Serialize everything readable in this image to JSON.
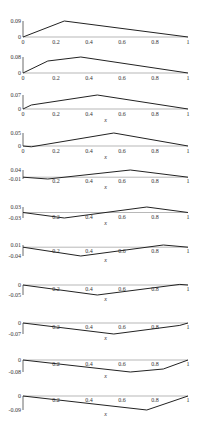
{
  "chart_data": [
    {
      "type": "line",
      "panel": 1,
      "top": 21,
      "base": 37,
      "ymax_label": "0.09",
      "ymin_label": "0",
      "ymax": 0.09,
      "ymin": 0,
      "x": [
        0,
        0.25,
        1
      ],
      "y": [
        0,
        0.09,
        0
      ],
      "xticks": [
        "0",
        "0.2",
        "0.4",
        "0.6",
        "0.8",
        "1"
      ],
      "xlabel": "",
      "xtick_below": true
    },
    {
      "type": "line",
      "panel": 2,
      "top": 57,
      "base": 73,
      "ymax_label": "0.08",
      "ymin_label": "0",
      "ymax": 0.08,
      "ymin": 0,
      "x": [
        0,
        0.15,
        0.35,
        1
      ],
      "y": [
        0,
        0.06,
        0.08,
        0
      ],
      "xticks": [
        "0",
        "0.2",
        "0.4",
        "0.6",
        "0.8",
        "1"
      ],
      "xlabel": "",
      "xtick_below": true
    },
    {
      "type": "line",
      "panel": 3,
      "top": 95,
      "base": 109,
      "ymax_label": "0.07",
      "ymin_label": "0",
      "ymax": 0.07,
      "ymin": 0,
      "x": [
        0,
        0.05,
        0.45,
        1
      ],
      "y": [
        0,
        0.02,
        0.07,
        0
      ],
      "xticks": [
        "0",
        "0.2",
        "0.4",
        "0.6",
        "0.8",
        "1"
      ],
      "xlabel": "x",
      "xtick_below": true
    },
    {
      "type": "line",
      "panel": 4,
      "top": 133,
      "base": 146,
      "ymax_label": "0.05",
      "ymin_label": "0",
      "ymax": 0.05,
      "ymin": 0,
      "x": [
        0,
        0.05,
        0.55,
        1
      ],
      "y": [
        0,
        -0.003,
        0.05,
        0
      ],
      "xticks": [
        "0",
        "0.2",
        "0.4",
        "0.6",
        "0.8",
        "1"
      ],
      "xlabel": "x",
      "xtick_below": true
    },
    {
      "type": "line",
      "panel": 5,
      "top": 170,
      "base": 179,
      "ymax_label": "0.04",
      "ymin_label": "-0.01",
      "ymax": 0.04,
      "ymin": -0.01,
      "x": [
        0,
        0.15,
        0.65,
        1
      ],
      "y": [
        0,
        -0.01,
        0.04,
        0
      ],
      "xticks": [
        "0.2",
        "0.4",
        "0.6",
        "0.8",
        "1"
      ],
      "xlabel": "x",
      "xtick_below": false
    },
    {
      "type": "line",
      "panel": 6,
      "top": 207,
      "base": 218,
      "ymax_label": "0.03",
      "ymin_label": "-0.03",
      "ymax": 0.03,
      "ymin": -0.03,
      "x": [
        0,
        0.25,
        0.75,
        1
      ],
      "y": [
        0,
        -0.03,
        0.03,
        0
      ],
      "xticks": [
        "0.2",
        "0.4",
        "0.6",
        "0.8",
        "1"
      ],
      "xlabel": "x",
      "xtick_below": false
    },
    {
      "type": "line",
      "panel": 7,
      "top": 245,
      "base": 256,
      "ymax_label": "0.01",
      "ymin_label": "-0.04",
      "ymax": 0.01,
      "ymin": -0.04,
      "x": [
        0,
        0.35,
        0.85,
        1
      ],
      "y": [
        0,
        -0.04,
        0.01,
        0
      ],
      "xticks": [
        "0.2",
        "0.4",
        "0.6",
        "0.8",
        "1"
      ],
      "xlabel": "x",
      "xtick_below": false
    },
    {
      "type": "line",
      "panel": 8,
      "top": 285,
      "base": 295,
      "ymax_label": "0",
      "ymin_label": "-0.05",
      "ymax": 0,
      "ymin": -0.05,
      "x": [
        0,
        0.45,
        0.95,
        1
      ],
      "y": [
        0,
        -0.05,
        0.003,
        0
      ],
      "xticks": [
        "0.2",
        "0.4",
        "0.6",
        "0.8",
        "1"
      ],
      "xlabel": "x",
      "xtick_below": false
    },
    {
      "type": "line",
      "panel": 9,
      "top": 323,
      "base": 334,
      "ymax_label": "0",
      "ymin_label": "-0.07",
      "ymax": 0,
      "ymin": -0.07,
      "x": [
        0,
        0.55,
        0.95,
        1
      ],
      "y": [
        0,
        -0.07,
        -0.015,
        0
      ],
      "xticks": [
        "0.2",
        "0.4",
        "0.6",
        "0.8",
        "1"
      ],
      "xlabel": "x",
      "xtick_below": false
    },
    {
      "type": "line",
      "panel": 10,
      "top": 360,
      "base": 372,
      "ymax_label": "0",
      "ymin_label": "-0.08",
      "ymax": 0,
      "ymin": -0.08,
      "x": [
        0,
        0.65,
        0.85,
        1
      ],
      "y": [
        0,
        -0.08,
        -0.06,
        0
      ],
      "xticks": [
        "0.2",
        "0.4",
        "0.6",
        "0.8",
        "1"
      ],
      "xlabel": "x",
      "xtick_below": false
    },
    {
      "type": "line",
      "panel": 11,
      "top": 396,
      "base": 410,
      "ymax_label": "0",
      "ymin_label": "-0.09",
      "ymax": 0,
      "ymin": -0.09,
      "x": [
        0,
        0.75,
        1
      ],
      "y": [
        0,
        -0.09,
        0
      ],
      "xticks": [
        "0.2",
        "0.4",
        "0.6",
        "0.8",
        "1"
      ],
      "xlabel": "x",
      "xtick_below": false
    }
  ],
  "layout": {
    "x0": 23,
    "x1": 188,
    "line_color": "#222222",
    "axis_color": "#444444"
  }
}
